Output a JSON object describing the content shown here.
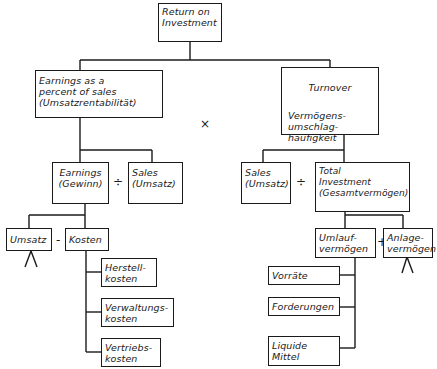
{
  "diagram": {
    "title": "Return on Investment",
    "nodes": {
      "roi": "Return on\nInvestment",
      "earnings_pct": "Earnings as a\npercent of sales\n(Umsatzrentabilität)",
      "turnover_title": "Turnover",
      "turnover_sub": "Vermögens-\numschlag-\nhäufigkeit",
      "earnings": "Earnings\n(Gewinn)",
      "sales_left": "Sales\n(Umsatz)",
      "sales_right": "Sales\n(Umsatz)",
      "total_investment": "Total\nInvestment\n(Gesamtvermögen)",
      "umsatz": "Umsatz",
      "kosten": "Kosten",
      "herstellkosten": "Herstell-\nkosten",
      "verwaltungskosten": "Verwaltungs-\nkosten",
      "vertriebskosten": "Vertriebs-\nkosten",
      "umlaufvermoegen": "Umlauf-\nvermögen",
      "anlagevermoegen": "Anlage-\nvermögen",
      "vorraete": "Vorräte",
      "forderungen": "Forderungen",
      "liquide_mittel": "Liquide\nMittel"
    },
    "operators": {
      "multiply": "×",
      "divide_left": "÷",
      "divide_right": "÷",
      "minus": "-",
      "plus": "+"
    }
  }
}
